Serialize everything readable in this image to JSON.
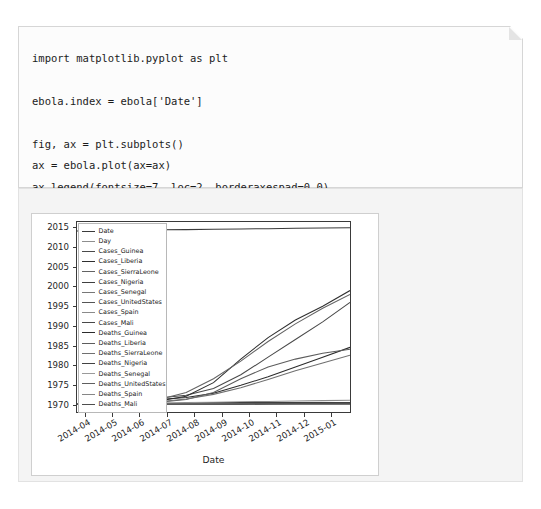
{
  "notebook": {
    "code_cell": {
      "language": "python",
      "source": "import matplotlib.pyplot as plt\n\nebola.index = ebola['Date']\n\nfig, ax = plt.subplots()\nax = ebola.plot(ax=ax)\nax.legend(fontsize=7, loc=2, borderaxespad=0.0)\nplt.show()"
    }
  },
  "chart_data": {
    "type": "line",
    "title": "",
    "xlabel": "Date",
    "ylabel": "",
    "grid": false,
    "legend_position": "upper left",
    "legend_fontsize": 7,
    "xlim": [
      "2014-03-22",
      "2015-01-20"
    ],
    "ylim": [
      1968,
      2016.5
    ],
    "yticks": [
      1970,
      1975,
      1980,
      1985,
      1990,
      1995,
      2000,
      2005,
      2010,
      2015
    ],
    "ytick_labels": [
      "1970",
      "1975",
      "1980",
      "1985",
      "1990",
      "1995",
      "2000",
      "2005",
      "2010",
      "2015"
    ],
    "xticks": [
      "2014-04",
      "2014-05",
      "2014-06",
      "2014-07",
      "2014-08",
      "2014-09",
      "2014-10",
      "2014-11",
      "2014-12",
      "2015-01"
    ],
    "xtick_labels": [
      "2014-04",
      "2014-05",
      "2014-06",
      "2014-07",
      "2014-08",
      "2014-09",
      "2014-10",
      "2014-11",
      "2014-12",
      "2015-01"
    ],
    "x": [
      "2014-03-22",
      "2014-04-21",
      "2014-05-21",
      "2014-06-20",
      "2014-07-20",
      "2014-08-19",
      "2014-09-18",
      "2014-10-18",
      "2014-11-17",
      "2014-12-17",
      "2015-01-16"
    ],
    "series": [
      {
        "name": "Date",
        "color": "#3b3b3b",
        "values": [
          2014.2,
          2014.3,
          2014.4,
          2014.5,
          2014.55,
          2014.63,
          2014.72,
          2014.8,
          2014.88,
          2014.96,
          2015.04
        ]
      },
      {
        "name": "Day",
        "color": "#8e8e8e",
        "values": [
          1970.0,
          1970.1,
          1970.2,
          1970.3,
          1970.4,
          1970.5,
          1970.6,
          1970.7,
          1970.8,
          1970.9,
          1971.0
        ]
      },
      {
        "name": "Cases_Guinea",
        "color": "#4a4a4a",
        "values": [
          1970.0,
          1970.5,
          1971.0,
          1971.6,
          1972.3,
          1974.0,
          1977.5,
          1982.0,
          1986.5,
          1991.0,
          1996.0
        ]
      },
      {
        "name": "Cases_Liberia",
        "color": "#2f2f2f",
        "values": [
          1970.0,
          1970.1,
          1970.3,
          1970.8,
          1972.0,
          1975.5,
          1981.5,
          1987.0,
          1991.5,
          1995.0,
          1999.0
        ]
      },
      {
        "name": "Cases_SierraLeone",
        "color": "#636363",
        "values": [
          1970.0,
          1970.0,
          1970.4,
          1971.2,
          1973.0,
          1976.5,
          1981.0,
          1986.0,
          1990.5,
          1994.5,
          1998.0
        ]
      },
      {
        "name": "Cases_Nigeria",
        "color": "#3f3f3f",
        "values": [
          1970.0,
          1970.0,
          1970.0,
          1970.0,
          1970.1,
          1970.3,
          1970.4,
          1970.4,
          1970.4,
          1970.4,
          1970.4
        ]
      },
      {
        "name": "Cases_Senegal",
        "color": "#777777",
        "values": [
          1970.0,
          1970.0,
          1970.0,
          1970.0,
          1970.0,
          1970.05,
          1970.1,
          1970.1,
          1970.1,
          1970.1,
          1970.1
        ]
      },
      {
        "name": "Cases_UnitedStates",
        "color": "#555555",
        "values": [
          1970.0,
          1970.0,
          1970.0,
          1970.0,
          1970.0,
          1970.0,
          1970.05,
          1970.1,
          1970.1,
          1970.1,
          1970.1
        ]
      },
      {
        "name": "Cases_Spain",
        "color": "#8a8a8a",
        "values": [
          1970.0,
          1970.0,
          1970.0,
          1970.0,
          1970.0,
          1970.0,
          1970.03,
          1970.05,
          1970.05,
          1970.05,
          1970.05
        ]
      },
      {
        "name": "Cases_Mali",
        "color": "#484848",
        "values": [
          1970.0,
          1970.0,
          1970.0,
          1970.0,
          1970.0,
          1970.0,
          1970.0,
          1970.05,
          1970.15,
          1970.2,
          1970.2
        ]
      },
      {
        "name": "Deaths_Guinea",
        "color": "#2b2b2b",
        "values": [
          1970.0,
          1970.4,
          1970.8,
          1971.2,
          1971.7,
          1972.8,
          1974.8,
          1977.0,
          1979.5,
          1982.0,
          1984.5
        ]
      },
      {
        "name": "Deaths_Liberia",
        "color": "#5c5c5c",
        "values": [
          1970.0,
          1970.05,
          1970.2,
          1970.5,
          1971.2,
          1973.0,
          1976.5,
          1979.5,
          1981.5,
          1983.0,
          1984.0
        ]
      },
      {
        "name": "Deaths_SierraLeone",
        "color": "#707070",
        "values": [
          1970.0,
          1970.0,
          1970.2,
          1970.6,
          1971.3,
          1972.5,
          1974.2,
          1976.3,
          1978.5,
          1980.5,
          1982.5
        ]
      },
      {
        "name": "Deaths_Nigeria",
        "color": "#414141",
        "values": [
          1970.0,
          1970.0,
          1970.0,
          1970.0,
          1970.05,
          1970.1,
          1970.15,
          1970.15,
          1970.15,
          1970.15,
          1970.15
        ]
      },
      {
        "name": "Deaths_Senegal",
        "color": "#9a9a9a",
        "values": [
          1970.0,
          1970.0,
          1970.0,
          1970.0,
          1970.0,
          1970.0,
          1970.0,
          1970.0,
          1970.0,
          1970.0,
          1970.0
        ]
      },
      {
        "name": "Deaths_UnitedStates",
        "color": "#5f5f5f",
        "values": [
          1970.0,
          1970.0,
          1970.0,
          1970.0,
          1970.0,
          1970.0,
          1970.0,
          1970.03,
          1970.03,
          1970.03,
          1970.03
        ]
      },
      {
        "name": "Deaths_Spain",
        "color": "#868686",
        "values": [
          1970.0,
          1970.0,
          1970.0,
          1970.0,
          1970.0,
          1970.0,
          1970.0,
          1970.0,
          1970.0,
          1970.0,
          1970.0
        ]
      },
      {
        "name": "Deaths_Mali",
        "color": "#4d4d4d",
        "values": [
          1970.0,
          1970.0,
          1970.0,
          1970.0,
          1970.0,
          1970.0,
          1970.0,
          1970.03,
          1970.1,
          1970.13,
          1970.13
        ]
      }
    ]
  }
}
